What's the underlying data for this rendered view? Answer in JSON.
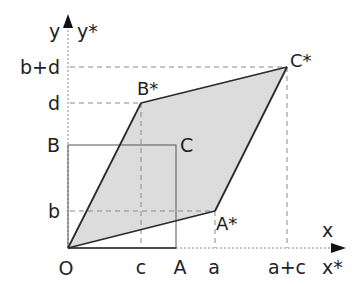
{
  "diagram": {
    "type": "linear-transformation-unit-square",
    "colors": {
      "fill": "#dcdcdc",
      "outline": "#2a2a2a",
      "square": "#555555",
      "guide": "#888888"
    },
    "axes": {
      "x_label": "x",
      "x_star_label": "x*",
      "y_label": "y",
      "y_star_label": "y*"
    },
    "points": {
      "origin": "O",
      "A": "A",
      "B": "B",
      "C": "C",
      "A_star": "A*",
      "B_star": "B*",
      "C_star": "C*"
    },
    "x_ticks": [
      "c",
      "a",
      "a+c"
    ],
    "y_ticks": [
      "b",
      "d",
      "b+d"
    ]
  }
}
